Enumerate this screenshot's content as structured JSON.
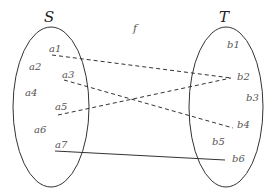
{
  "diagram": {
    "function_label": "f",
    "domain": {
      "name": "S",
      "elements": [
        "a1",
        "a2",
        "a3",
        "a4",
        "a5",
        "a6",
        "a7"
      ]
    },
    "codomain": {
      "name": "T",
      "elements": [
        "b1",
        "b2",
        "b3",
        "b4",
        "b5",
        "b6"
      ]
    },
    "mappings": [
      {
        "from": "a1",
        "to": "b2",
        "style": "dashed"
      },
      {
        "from": "a3",
        "to": "b4",
        "style": "dashed"
      },
      {
        "from": "a5",
        "to": "b2",
        "style": "dashed"
      },
      {
        "from": "a7",
        "to": "b6",
        "style": "solid"
      }
    ],
    "colors": {
      "stroke": "#333333",
      "label": "#555555"
    }
  }
}
